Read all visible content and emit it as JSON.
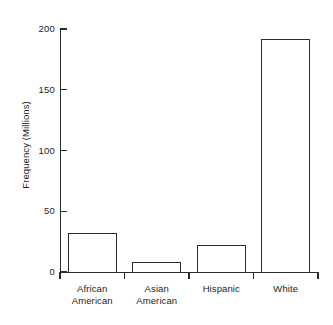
{
  "chart_data": {
    "type": "bar",
    "title": "",
    "subtitle": "",
    "xlabel": "",
    "ylabel": "Frequency (Millions)",
    "categories": [
      "African American",
      "Asian American",
      "Hispanic",
      "White"
    ],
    "category_lines": [
      [
        "African",
        "American"
      ],
      [
        "Asian",
        "American"
      ],
      [
        "Hispanic"
      ],
      [
        "White"
      ]
    ],
    "values": [
      32,
      8,
      22,
      192
    ],
    "ylim": [
      0,
      200
    ],
    "yticks": [
      0,
      50,
      100,
      150,
      200
    ],
    "ytick_labels": [
      "0",
      "50",
      "100",
      "150",
      "200"
    ],
    "grid": false,
    "legend": false,
    "legend_position": "none",
    "bar_style": "outlined",
    "colors": {
      "bar_fill": "#ffffff",
      "bar_edge": "#2b2b2b",
      "axis": "#2b2b2b",
      "text": "#1d1d1d",
      "background": "#ffffff"
    }
  }
}
